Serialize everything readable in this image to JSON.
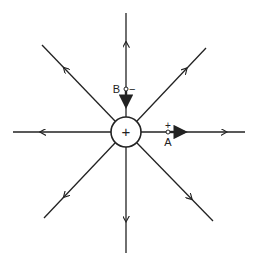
{
  "diagram": {
    "colors": {
      "line": "#222222",
      "background": "#ffffff"
    },
    "central_charge": {
      "sign": "+",
      "cx": 126,
      "cy": 132,
      "r": 15
    },
    "field_lines": [
      {
        "name": "up",
        "x1": 126,
        "y1": 117,
        "x2": 126,
        "y2": 13,
        "arrow_at": 0.72
      },
      {
        "name": "down",
        "x1": 126,
        "y1": 147,
        "x2": 126,
        "y2": 253,
        "arrow_at": 0.7
      },
      {
        "name": "left",
        "x1": 111,
        "y1": 132,
        "x2": 13,
        "y2": 132,
        "arrow_at": 0.72
      },
      {
        "name": "right",
        "x1": 141,
        "y1": 132,
        "x2": 245,
        "y2": 132,
        "arrow_at": 0.82
      },
      {
        "name": "upper-left",
        "x1": 115,
        "y1": 121,
        "x2": 42,
        "y2": 45,
        "arrow_at": 0.7
      },
      {
        "name": "upper-right",
        "x1": 137,
        "y1": 121,
        "x2": 206,
        "y2": 48,
        "arrow_at": 0.72
      },
      {
        "name": "lower-left",
        "x1": 115,
        "y1": 143,
        "x2": 44,
        "y2": 218,
        "arrow_at": 0.72
      },
      {
        "name": "lower-right",
        "x1": 137,
        "y1": 143,
        "x2": 213,
        "y2": 221,
        "arrow_at": 0.72
      }
    ],
    "test_points": [
      {
        "label": "A",
        "charge_sign": "+",
        "x": 168,
        "y": 132,
        "force_direction": "away from charge (right)"
      },
      {
        "label": "B",
        "charge_sign": "−",
        "x": 126,
        "y": 89,
        "force_direction": "toward charge (down)"
      }
    ],
    "labels": {
      "center_sign": "+",
      "point_a": "A",
      "point_a_sign": "+",
      "point_b": "B",
      "point_b_sign": "−"
    }
  }
}
